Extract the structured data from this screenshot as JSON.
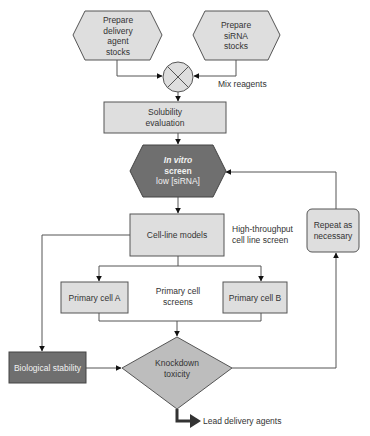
{
  "colors": {
    "light_fill": "#dedede",
    "dark_fill": "#6f6f6f",
    "diamond_fill": "#bdbdbd",
    "stroke": "#555555",
    "background": "#ffffff"
  },
  "nodes": {
    "prepare_delivery": {
      "shape": "hexagon",
      "lines": [
        "Prepare",
        "delivery",
        "agent",
        "stocks"
      ]
    },
    "prepare_sirna": {
      "shape": "hexagon",
      "lines": [
        "Prepare",
        "siRNA",
        "stocks"
      ]
    },
    "mix": {
      "shape": "circle-x",
      "label": "Mix reagents"
    },
    "solubility": {
      "shape": "rect",
      "lines": [
        "Solubility",
        "evaluation"
      ]
    },
    "in_vitro": {
      "shape": "hexagon-dark",
      "lines": [
        "In vitro",
        "screen",
        "low [siRNA]"
      ]
    },
    "cell_line": {
      "shape": "rect",
      "label": "Cell-line models",
      "annotation": [
        "High-throughput",
        "cell line screen"
      ]
    },
    "primary_a": {
      "shape": "rect",
      "label": "Primary cell A"
    },
    "primary_b": {
      "shape": "rect",
      "label": "Primary cell B"
    },
    "primary_annotation": [
      "Primary cell",
      "screens"
    ],
    "bio_stability": {
      "shape": "rect-dark",
      "label": "Biological stability"
    },
    "knockdown": {
      "shape": "diamond",
      "lines": [
        "Knockdown",
        "toxicity"
      ]
    },
    "repeat": {
      "shape": "rounded-rect",
      "lines": [
        "Repeat as",
        "necessary"
      ]
    },
    "output": {
      "label": "Lead delivery agents"
    }
  }
}
